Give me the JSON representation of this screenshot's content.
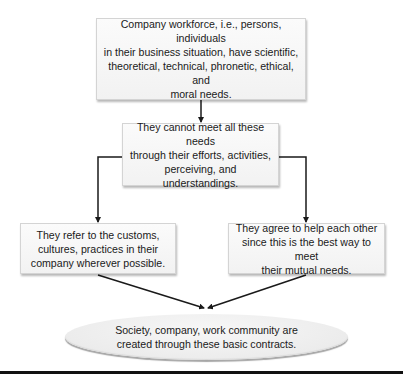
{
  "diagram": {
    "type": "flowchart",
    "nodes": {
      "top": {
        "lines": [
          "Company workforce, i.e., persons, individuals",
          "in their business situation, have scientific,",
          "theoretical, technical, phronetic, ethical, and",
          "moral needs."
        ]
      },
      "middle": {
        "lines": [
          "They cannot meet all these needs",
          "through their efforts, activities,",
          "perceiving, and understandings."
        ]
      },
      "left": {
        "lines": [
          "They refer to the customs,",
          "cultures, practices in their",
          "company wherever possible."
        ]
      },
      "right": {
        "lines": [
          "They agree to help each other",
          "since this is the best way to meet",
          "their mutual needs."
        ]
      },
      "bottom": {
        "shape": "ellipse",
        "lines": [
          "Society, company, work community are",
          "created through these basic contracts."
        ]
      }
    },
    "edges": [
      {
        "from": "top",
        "to": "middle",
        "style": "straight-arrow"
      },
      {
        "from": "middle",
        "to": "left",
        "style": "elbow-arrow"
      },
      {
        "from": "middle",
        "to": "right",
        "style": "elbow-arrow"
      },
      {
        "from": "left",
        "to": "bottom",
        "style": "diagonal-arrow"
      },
      {
        "from": "right",
        "to": "bottom",
        "style": "diagonal-arrow"
      }
    ],
    "colors": {
      "box_fill": "#f5f5f5",
      "box_border": "#d4d4d4",
      "ellipse_fill": "#ececec",
      "line": "#1a1a1a",
      "rule": "#111111"
    }
  }
}
